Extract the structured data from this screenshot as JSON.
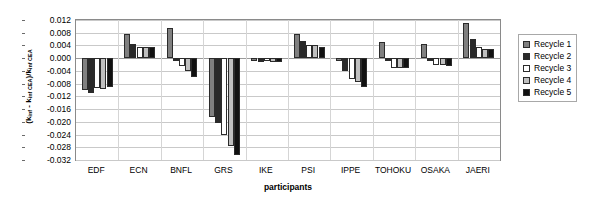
{
  "chart_data": {
    "type": "bar",
    "title": "",
    "xlabel": "participants",
    "ylabel": "(kinf - kinf CEA)/kinf CEA",
    "ylim": [
      -0.032,
      0.012
    ],
    "ytick_step": 0.004,
    "ytick_labels": [
      "0.012",
      "0.008",
      "0.004",
      "0.000",
      "-0.004",
      "-0.008",
      "-0.012",
      "-0.016",
      "-0.020",
      "-0.024",
      "-0.028",
      "-0.032"
    ],
    "ytick_values": [
      0.012,
      0.008,
      0.004,
      0.0,
      -0.004,
      -0.008,
      -0.012,
      -0.016,
      -0.02,
      -0.024,
      -0.028,
      -0.032
    ],
    "grid": true,
    "legend_position": "right",
    "categories": [
      "EDF",
      "ECN",
      "BNFL",
      "GRS",
      "IKE",
      "PSI",
      "IPPE",
      "TOHOKU",
      "OSAKA",
      "JAERI"
    ],
    "series": [
      {
        "name": "Recycle 1",
        "color": "#808080",
        "values": [
          -0.01,
          0.0075,
          0.0095,
          -0.0185,
          -0.001,
          0.0075,
          -0.001,
          0.005,
          0.0045,
          0.011
        ]
      },
      {
        "name": "Recycle 2",
        "color": "#2a2a2a",
        "values": [
          -0.011,
          0.0045,
          -0.001,
          -0.0205,
          -0.0012,
          0.0055,
          -0.004,
          -0.001,
          -0.0008,
          0.006
        ]
      },
      {
        "name": "Recycle 3",
        "color": "#ffffff",
        "values": [
          -0.0095,
          0.0035,
          -0.0025,
          -0.024,
          -0.0008,
          0.004,
          -0.0065,
          -0.003,
          -0.002,
          0.0035
        ]
      },
      {
        "name": "Recycle 4",
        "color": "#bfbfbf",
        "values": [
          -0.0098,
          0.0035,
          -0.004,
          -0.0275,
          -0.0012,
          0.004,
          -0.0075,
          -0.003,
          -0.002,
          0.003
        ]
      },
      {
        "name": "Recycle 5",
        "color": "#111111",
        "values": [
          -0.009,
          0.0035,
          -0.006,
          -0.0305,
          -0.0012,
          0.0035,
          -0.009,
          -0.003,
          -0.0025,
          0.003
        ]
      }
    ]
  },
  "legend": {
    "items": [
      {
        "label": "Recycle 1"
      },
      {
        "label": "Recycle 2"
      },
      {
        "label": "Recycle 3"
      },
      {
        "label": "Recycle 4"
      },
      {
        "label": "Recycle 5"
      }
    ]
  },
  "axis": {
    "x_title": "participants",
    "y_title_main": "(k",
    "y_title_full": "(kinf - kinf CEA)/kinf CEA"
  }
}
